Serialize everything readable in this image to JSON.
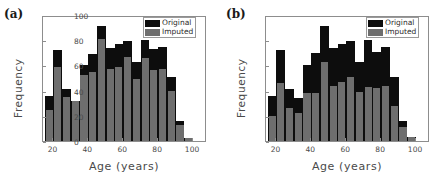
{
  "figure": {
    "panels": [
      {
        "tag": "(a)",
        "xlabel": "Age (years)",
        "ylabel": "Frequency",
        "legend": {
          "original": "Original",
          "imputed": "Imputed"
        }
      },
      {
        "tag": "(b)",
        "xlabel": "Age (years)",
        "ylabel": "Frequency",
        "legend": {
          "original": "Original",
          "imputed": "Imputed"
        }
      }
    ],
    "colors": {
      "original": "#0d0d0d",
      "imputed": "#6e6e6e",
      "axis": "#8d8d8d"
    }
  },
  "chart_data": [
    {
      "type": "bar",
      "title": "(a)",
      "xlabel": "Age (years)",
      "ylabel": "Frequency",
      "xlim": [
        14,
        108
      ],
      "ylim": [
        0,
        100
      ],
      "xticks": [
        20,
        40,
        60,
        80,
        100
      ],
      "yticks": [
        0,
        20,
        40,
        60,
        80,
        100
      ],
      "grid": false,
      "legend_position": "upper right",
      "bin_width": 5,
      "categories": [
        15,
        20,
        25,
        30,
        35,
        40,
        45,
        50,
        55,
        60,
        65,
        70,
        75,
        80,
        85,
        90,
        95
      ],
      "series": [
        {
          "name": "Original",
          "values": [
            36,
            72,
            41,
            32,
            60,
            69,
            91,
            74,
            77,
            79,
            63,
            80,
            73,
            75,
            51,
            16,
            2
          ]
        },
        {
          "name": "Imputed",
          "values": [
            25,
            59,
            35,
            32,
            52,
            55,
            81,
            57,
            59,
            67,
            49,
            66,
            56,
            57,
            40,
            13,
            2
          ]
        }
      ]
    },
    {
      "type": "bar",
      "title": "(b)",
      "xlabel": "Age (years)",
      "ylabel": "Frequency",
      "xlim": [
        14,
        108
      ],
      "ylim": [
        0,
        100
      ],
      "xticks": [
        20,
        40,
        60,
        80,
        100
      ],
      "yticks": [
        0,
        20,
        40,
        60,
        80,
        100
      ],
      "grid": false,
      "legend_position": "upper right",
      "bin_width": 5,
      "categories": [
        15,
        20,
        25,
        30,
        35,
        40,
        45,
        50,
        55,
        60,
        65,
        70,
        75,
        80,
        85,
        90,
        95
      ],
      "series": [
        {
          "name": "Original",
          "values": [
            36,
            72,
            41,
            34,
            60,
            70,
            91,
            74,
            77,
            79,
            63,
            80,
            71,
            75,
            51,
            16,
            3
          ]
        },
        {
          "name": "Imputed",
          "values": [
            20,
            46,
            26,
            22,
            38,
            38,
            63,
            44,
            47,
            51,
            39,
            43,
            42,
            44,
            28,
            11,
            3
          ]
        }
      ]
    }
  ]
}
